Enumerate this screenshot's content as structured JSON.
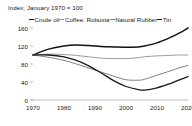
{
  "chart_data": {
    "type": "line",
    "title": "Index, January 1970 = 100",
    "xlabel": "",
    "ylabel": "",
    "xlim": [
      1970,
      2020
    ],
    "ylim": [
      0,
      170
    ],
    "yticks": [
      0,
      40,
      80,
      120,
      160
    ],
    "xticks": [
      1970,
      1980,
      1990,
      2000,
      2010,
      2020
    ],
    "grid": false,
    "legend_position": "top",
    "x": [
      1970,
      1975,
      1980,
      1984,
      1988,
      1992,
      1996,
      2000,
      2004,
      2006,
      2010,
      2014,
      2017,
      2020
    ],
    "series": [
      {
        "name": "Crude oil",
        "color": "#111111",
        "width": 1.5,
        "values": [
          100,
          113,
          120,
          122,
          121,
          119,
          118,
          117,
          118,
          120,
          127,
          138,
          148,
          160
        ]
      },
      {
        "name": "Coffee, Robusta",
        "color": "#9a9a9a",
        "width": 1.0,
        "values": [
          100,
          102,
          101,
          99,
          96,
          93,
          92,
          92,
          94,
          96,
          98,
          99,
          100,
          100
        ]
      },
      {
        "name": "Natural Rubber",
        "color": "#808080",
        "width": 1.0,
        "values": [
          100,
          95,
          88,
          80,
          71,
          62,
          53,
          45,
          44,
          46,
          55,
          64,
          71,
          77
        ]
      },
      {
        "name": "Tin",
        "color": "#1a1a1a",
        "width": 1.3,
        "values": [
          100,
          100,
          96,
          88,
          76,
          60,
          43,
          30,
          23,
          22,
          27,
          36,
          44,
          52
        ]
      }
    ]
  },
  "axis": {
    "ytick_labels": [
      "160",
      "120",
      "80",
      "40",
      "0"
    ],
    "xtick_labels": [
      "1970",
      "1980",
      "1990",
      "2000",
      "2010",
      "2020"
    ]
  },
  "legend": {
    "items": [
      {
        "label": "Crude oil",
        "color": "#111111"
      },
      {
        "label": "Coffee, Robusta",
        "color": "#9a9a9a"
      },
      {
        "label": "Natural Rubber",
        "color": "#808080"
      },
      {
        "label": "Tin",
        "color": "#1a1a1a"
      }
    ]
  }
}
